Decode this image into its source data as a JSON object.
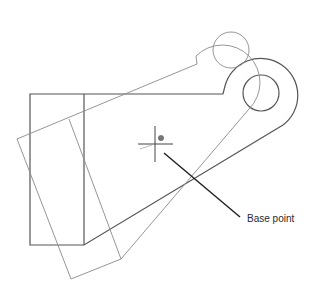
{
  "diagram": {
    "type": "cad-rotate-preview",
    "annotation": {
      "label": "Base point"
    },
    "colors": {
      "original_stroke": "#555555",
      "rotated_stroke": "#8a8a8a",
      "leader_stroke": "#222222",
      "crosshair_stroke": "#444444",
      "background": "#ffffff"
    },
    "icons": {
      "crosshair": "crosshair-cursor-icon",
      "base_point_marker": "base-point-marker-icon"
    }
  }
}
